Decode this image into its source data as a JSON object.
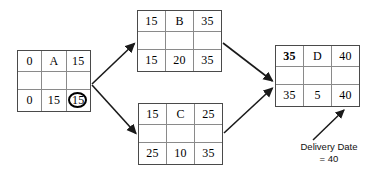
{
  "diagram": {
    "type": "activity-on-node-network",
    "title": "",
    "nodes": [
      {
        "id": "A",
        "label": "A",
        "early_start": "0",
        "early_finish": "15",
        "late_start": "0",
        "duration": "15",
        "late_finish": "15",
        "late_finish_circled": true
      },
      {
        "id": "B",
        "label": "B",
        "early_start": "15",
        "early_finish": "35",
        "late_start": "15",
        "duration": "20",
        "late_finish": "35",
        "late_finish_circled": false
      },
      {
        "id": "C",
        "label": "C",
        "early_start": "15",
        "early_finish": "25",
        "late_start": "25",
        "duration": "10",
        "late_finish": "35",
        "late_finish_circled": false
      },
      {
        "id": "D",
        "label": "D",
        "early_start": "35",
        "early_finish": "40",
        "late_start": "35",
        "duration": "5",
        "late_finish": "40",
        "late_finish_circled": false,
        "early_start_bold": true
      }
    ],
    "edges": [
      {
        "from": "A",
        "to": "B"
      },
      {
        "from": "A",
        "to": "C"
      },
      {
        "from": "B",
        "to": "D"
      },
      {
        "from": "C",
        "to": "D"
      }
    ],
    "annotation": {
      "line1": "Delivery Date",
      "line2": "= 40",
      "points_to": "D.early_finish"
    },
    "colors": {
      "box_border": "#4a4a4a",
      "cell_divider": "#8a8a8a",
      "arrow": "#1a1a1a",
      "circle_highlight": "#000000",
      "text": "#000000",
      "background": "#ffffff"
    }
  }
}
